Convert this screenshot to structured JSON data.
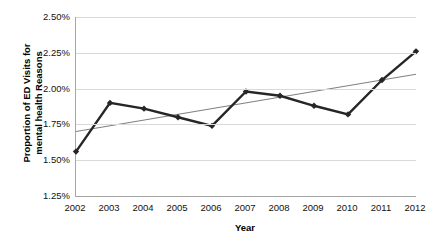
{
  "chart_data": {
    "type": "line",
    "title": "",
    "xlabel": "Year",
    "ylabel_line1": "Proportion of ED Visits for",
    "ylabel_line2": "mental health Reasons",
    "categories": [
      "2002",
      "2003",
      "2004",
      "2005",
      "2006",
      "2007",
      "2008",
      "2009",
      "2010",
      "2011",
      "2012"
    ],
    "x": [
      2002,
      2003,
      2004,
      2005,
      2006,
      2007,
      2008,
      2009,
      2010,
      2011,
      2012
    ],
    "ylim": [
      1.25,
      2.5
    ],
    "xlim": [
      2002,
      2012
    ],
    "ytick_labels": [
      "2.50%",
      "2.25%",
      "2.00%",
      "1.75%",
      "1.50%",
      "1.25%"
    ],
    "ytick_values": [
      2.5,
      2.25,
      2.0,
      1.75,
      1.5,
      1.25
    ],
    "grid": true,
    "legend": "none",
    "series": [
      {
        "name": "Proportion of ED Visits for mental health Reasons",
        "style": "line-with-diamond-markers",
        "color": "#262626",
        "values": [
          1.56,
          1.9,
          1.86,
          1.8,
          1.74,
          1.98,
          1.95,
          1.88,
          1.82,
          2.06,
          2.26
        ]
      },
      {
        "name": "Linear trend line",
        "style": "thin-straight-line",
        "color": "#808080",
        "endpoints": [
          {
            "x": 2002,
            "y": 1.7
          },
          {
            "x": 2012,
            "y": 2.1
          }
        ]
      }
    ]
  },
  "axis": {
    "x_title": "Year",
    "y_title_line1": "Proportion of ED Visits for",
    "y_title_line2": "mental health Reasons"
  }
}
